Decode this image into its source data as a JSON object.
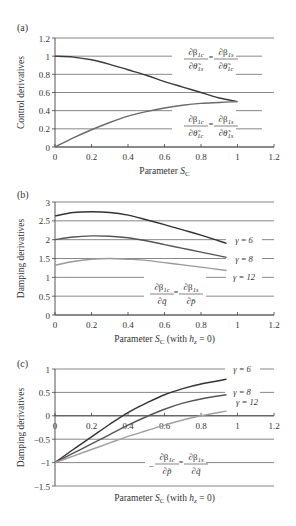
{
  "chart_data": [
    {
      "panel": "(a)",
      "type": "line",
      "title": "",
      "xlabel": "Parameter S_C",
      "ylabel": "Control derivatives",
      "xlim": [
        0,
        1.2
      ],
      "ylim": [
        0,
        1.2
      ],
      "xticks": [
        "0",
        "0.2",
        "0.4",
        "0.6",
        "0.8",
        "1",
        "1.2"
      ],
      "yticks": [
        "0",
        "0.2",
        "0.4",
        "0.6",
        "0.8",
        "1",
        "1.2"
      ],
      "grid": "horizontal",
      "series": [
        {
          "name": "∂β1c/∂θ̃1s = ∂β1s/∂θ̃1c",
          "color": "#3a3a3a",
          "x": [
            0,
            0.1,
            0.2,
            0.3,
            0.4,
            0.5,
            0.6,
            0.7,
            0.8,
            0.9,
            1.0
          ],
          "y": [
            1.0,
            0.99,
            0.96,
            0.91,
            0.85,
            0.79,
            0.72,
            0.66,
            0.6,
            0.54,
            0.5
          ]
        },
        {
          "name": "∂β1c/∂θ̃1c = ∂β1s/∂θ̃1s",
          "color": "#6a6a6a",
          "x": [
            0,
            0.1,
            0.2,
            0.3,
            0.4,
            0.5,
            0.6,
            0.7,
            0.8,
            0.9,
            1.0
          ],
          "y": [
            0.0,
            0.1,
            0.19,
            0.27,
            0.34,
            0.39,
            0.43,
            0.46,
            0.48,
            0.49,
            0.5
          ]
        }
      ],
      "annotations": [
        {
          "text_num1": "∂β",
          "sub1": "1c",
          "text_den1": "∂θ̃",
          "subd1": "1s",
          "text_num2": "∂β",
          "sub2": "1s",
          "text_den2": "∂θ̃",
          "subd2": "1c"
        },
        {
          "text_num1": "∂β",
          "sub1": "1c",
          "text_den1": "∂θ̃",
          "subd1": "1c",
          "text_num2": "∂β",
          "sub2": "1s",
          "text_den2": "∂θ̃",
          "subd2": "1s"
        }
      ]
    },
    {
      "panel": "(b)",
      "type": "line",
      "title": "",
      "xlabel": "Parameter S_C (with h_z = 0)",
      "ylabel": "Damping derivatives",
      "xlim": [
        0,
        1.2
      ],
      "ylim": [
        0,
        3
      ],
      "xticks": [
        "0",
        "0.2",
        "0.4",
        "0.6",
        "0.8",
        "1",
        "1.2"
      ],
      "yticks": [
        "0",
        "0.5",
        "1",
        "1.5",
        "2",
        "2.5",
        "3"
      ],
      "grid": "horizontal",
      "series": [
        {
          "name": "γ = 6",
          "color": "#333333",
          "x": [
            0,
            0.1,
            0.2,
            0.3,
            0.4,
            0.5,
            0.6,
            0.7,
            0.8,
            0.94
          ],
          "y": [
            2.63,
            2.72,
            2.74,
            2.72,
            2.65,
            2.53,
            2.4,
            2.26,
            2.12,
            1.9
          ]
        },
        {
          "name": "γ = 8",
          "color": "#555555",
          "x": [
            0,
            0.1,
            0.2,
            0.3,
            0.4,
            0.5,
            0.6,
            0.7,
            0.8,
            0.94
          ],
          "y": [
            2.0,
            2.07,
            2.1,
            2.09,
            2.05,
            1.97,
            1.87,
            1.77,
            1.67,
            1.53
          ]
        },
        {
          "name": "γ = 12",
          "color": "#9a9a9a",
          "x": [
            0,
            0.1,
            0.2,
            0.3,
            0.4,
            0.5,
            0.6,
            0.7,
            0.8,
            0.94
          ],
          "y": [
            1.32,
            1.42,
            1.48,
            1.5,
            1.48,
            1.45,
            1.39,
            1.33,
            1.27,
            1.18
          ]
        }
      ],
      "annotation": {
        "num1": "∂β",
        "sub1": "1c",
        "den1": "∂q̄",
        "num2": "∂β",
        "sub2": "1s",
        "den2": "∂p̄"
      }
    },
    {
      "panel": "(c)",
      "type": "line",
      "title": "",
      "xlabel": "Parameter S_C (with h_z = 0)",
      "ylabel": "Damping derivatives",
      "xlim": [
        0,
        1.2
      ],
      "ylim": [
        -1.5,
        1
      ],
      "xticks": [
        "0",
        "0.2",
        "0.4",
        "0.6",
        "0.8",
        "1",
        "1.2"
      ],
      "yticks": [
        "−1.5",
        "−1",
        "−0.5",
        "0",
        "0.5",
        "1"
      ],
      "grid": "horizontal",
      "series": [
        {
          "name": "γ = 6",
          "color": "#333333",
          "x": [
            0,
            0.1,
            0.2,
            0.3,
            0.4,
            0.5,
            0.6,
            0.7,
            0.8,
            0.94
          ],
          "y": [
            -1.0,
            -0.72,
            -0.45,
            -0.18,
            0.07,
            0.27,
            0.45,
            0.58,
            0.68,
            0.78
          ]
        },
        {
          "name": "γ = 8",
          "color": "#555555",
          "x": [
            0,
            0.1,
            0.2,
            0.3,
            0.4,
            0.5,
            0.6,
            0.7,
            0.8,
            0.94
          ],
          "y": [
            -1.0,
            -0.8,
            -0.6,
            -0.4,
            -0.2,
            -0.02,
            0.14,
            0.27,
            0.36,
            0.45
          ]
        },
        {
          "name": "γ = 12",
          "color": "#a0a0a0",
          "x": [
            0,
            0.1,
            0.2,
            0.3,
            0.4,
            0.5,
            0.6,
            0.7,
            0.8,
            0.94
          ],
          "y": [
            -1.0,
            -0.86,
            -0.72,
            -0.58,
            -0.44,
            -0.32,
            -0.2,
            -0.09,
            0.0,
            0.1
          ]
        }
      ],
      "annotation": {
        "prefix": "−",
        "num1": "∂β",
        "sub1": "1c",
        "den1": "∂p̃",
        "num2": "∂β",
        "sub2": "1s",
        "den2": "∂q̃"
      }
    }
  ],
  "labels": {
    "a": "(a)",
    "b": "(b)",
    "c": "(c)",
    "ylabel_a": "Control derivatives",
    "ylabel_b": "Damping derivatives",
    "ylabel_c": "Damping derivatives",
    "xlabel_a_main": "Parameter ",
    "xlabel_a_sym": "S",
    "xlabel_a_sub": "C",
    "xlabel_bc_main": "Parameter ",
    "xlabel_bc_sym": "S",
    "xlabel_bc_sub": "C",
    "xlabel_bc_tail1": " (with ",
    "xlabel_bc_h": "h",
    "xlabel_bc_hsub": "z",
    "xlabel_bc_tail2": " = 0)",
    "gamma6": "γ = 6",
    "gamma8": "γ = 8",
    "gamma12": "γ = 12",
    "eq": "="
  }
}
